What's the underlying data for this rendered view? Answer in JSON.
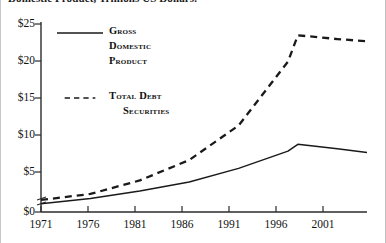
{
  "title_cropped": "Domestic Product, Trillions US Dollars.",
  "legend": {
    "items": [
      {
        "label": "Gross",
        "label2": "Domestic",
        "label3": "Product",
        "style": "solid",
        "swatch": "solid-line-swatch"
      },
      {
        "label": "Total Debt",
        "label2": "Securities",
        "style": "dashed",
        "swatch": "dashed-line-swatch"
      }
    ]
  },
  "axes": {
    "y_ticks": [
      "$0",
      "$5",
      "$10",
      "$15",
      "$20",
      "$25"
    ],
    "x_ticks": [
      "1971",
      "1976",
      "1981",
      "1986",
      "1991",
      "1996",
      "2001"
    ],
    "y_axis_break": true
  },
  "chart_data": {
    "type": "line",
    "title": "Domestic Product, Trillions US Dollars.",
    "xlabel": "",
    "ylabel": "Trillions US Dollars",
    "xlim": [
      1971,
      2004
    ],
    "ylim": [
      0,
      25
    ],
    "grid": false,
    "legend_position": "inside-top-left",
    "x": [
      1971,
      1976,
      1981,
      1986,
      1991,
      1996,
      1997,
      2001,
      2004
    ],
    "series": [
      {
        "name": "Gross Domestic Product",
        "style": "solid",
        "color": "#1a1a1a",
        "values": [
          1.1,
          1.8,
          2.8,
          4.0,
          5.8,
          8.1,
          9.0,
          8.4,
          7.9
        ]
      },
      {
        "name": "Total Debt Securities",
        "style": "dashed",
        "color": "#1a1a1a",
        "values": [
          1.6,
          2.4,
          4.2,
          6.9,
          11.5,
          20.0,
          23.5,
          23.0,
          22.7
        ]
      }
    ]
  }
}
